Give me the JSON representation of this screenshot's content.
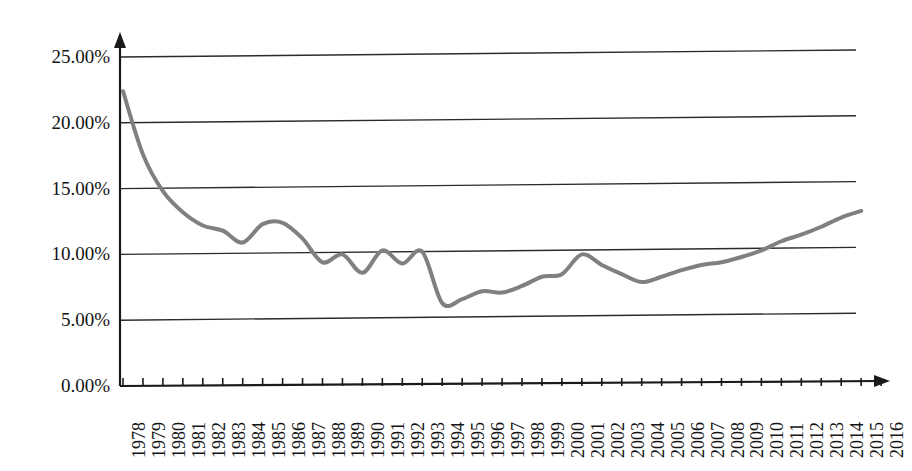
{
  "chart_data": {
    "type": "line",
    "title": "",
    "subtitle": "",
    "xlabel": "",
    "ylabel": "",
    "legend": [],
    "legend_position": "none",
    "grid": "horizontal",
    "ylim": [
      0,
      25
    ],
    "ytick_values": [
      0,
      5,
      10,
      15,
      20,
      25
    ],
    "ytick_labels": [
      "0.00%",
      "5.00%",
      "10.00%",
      "15.00%",
      "20.00%",
      "25.00%"
    ],
    "y_unit": "percent",
    "xlim": [
      1978,
      2016
    ],
    "categories": [
      "1978",
      "1979",
      "1980",
      "1981",
      "1982",
      "1983",
      "1984",
      "1985",
      "1986",
      "1987",
      "1988",
      "1989",
      "1990",
      "1991",
      "1992",
      "1993",
      "1994",
      "1995",
      "1996",
      "1997",
      "1998",
      "1999",
      "2000",
      "2001",
      "2002",
      "2003",
      "2004",
      "2005",
      "2006",
      "2007",
      "2008",
      "2009",
      "2010",
      "2011",
      "2012",
      "2013",
      "2014",
      "2015",
      "2016"
    ],
    "series": [
      {
        "name": "series-1",
        "color": "#808080",
        "line_width": 4,
        "markers": false,
        "values": [
          22.4,
          17.6,
          14.8,
          13.2,
          12.2,
          11.8,
          10.9,
          12.3,
          12.4,
          11.2,
          9.4,
          10.0,
          8.6,
          10.3,
          9.3,
          10.2,
          6.3,
          6.6,
          7.2,
          7.1,
          7.6,
          8.3,
          8.5,
          10.0,
          9.2,
          8.5,
          7.9,
          8.3,
          8.8,
          9.2,
          9.4,
          9.8,
          10.3,
          11.0,
          11.5,
          12.1,
          12.8,
          13.3,
          null
        ]
      }
    ],
    "axis_style": {
      "y_axis_arrow": true,
      "x_axis_arrow": true,
      "tick_direction": "up",
      "axis_color": "#1a1a1a",
      "gridline_color": "#2b2b2b"
    }
  },
  "axes": {
    "y_ticks": [
      {
        "label": "25.00%",
        "value": 25
      },
      {
        "label": "20.00%",
        "value": 20
      },
      {
        "label": "15.00%",
        "value": 15
      },
      {
        "label": "10.00%",
        "value": 10
      },
      {
        "label": "5.00%",
        "value": 5
      },
      {
        "label": "0.00%",
        "value": 0
      }
    ],
    "x_ticks": [
      "1978",
      "1979",
      "1980",
      "1981",
      "1982",
      "1983",
      "1984",
      "1985",
      "1986",
      "1987",
      "1988",
      "1989",
      "1990",
      "1991",
      "1992",
      "1993",
      "1994",
      "1995",
      "1996",
      "1997",
      "1998",
      "1999",
      "2000",
      "2001",
      "2002",
      "2003",
      "2004",
      "2005",
      "2006",
      "2007",
      "2008",
      "2009",
      "2010",
      "2011",
      "2012",
      "2013",
      "2014",
      "2015",
      "2016"
    ]
  },
  "colors": {
    "background": "#ffffff",
    "line": "#808080",
    "axis": "#1a1a1a",
    "grid": "#2b2b2b",
    "text": "#141414"
  }
}
